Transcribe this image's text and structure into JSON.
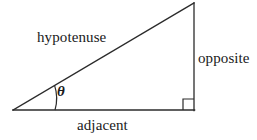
{
  "figure": {
    "background_color": "#ffffff",
    "stroke_color": "#2b2b2b",
    "text_color": "#1a1a1a",
    "labels": {
      "hypotenuse": "hypotenuse",
      "opposite": "opposite",
      "adjacent": "adjacent",
      "theta": "θ"
    },
    "geometry": {
      "left_vertex": [
        13,
        110
      ],
      "right_angle_vertex": [
        194,
        110
      ],
      "apex_vertex": [
        194,
        3
      ],
      "angle_arc_radius": 42,
      "right_angle_marker_size": 11
    }
  }
}
